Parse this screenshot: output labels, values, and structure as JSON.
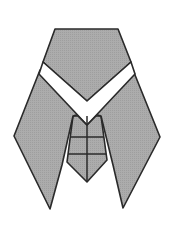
{
  "diagram": {
    "colors": {
      "fill": "#a9a9a9",
      "stroke": "#2a2a2a",
      "band": "#ffffff",
      "background": "#ffffff"
    },
    "parts": [
      "head",
      "white-collar-band",
      "left-wing",
      "right-wing",
      "abdomen"
    ]
  }
}
